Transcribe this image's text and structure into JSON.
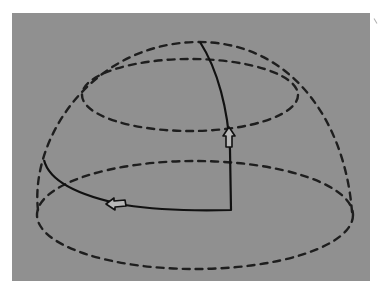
{
  "figure": {
    "colors": {
      "background": "#909090",
      "lines": "#1e1e1e",
      "arrow_fill": "#b8b8b8"
    },
    "elements": {
      "outer_dome": "dashed",
      "upper_latitude_circle": "dashed",
      "lower_latitude_circle": "dashed",
      "path": "solid",
      "arrows": [
        {
          "direction": "up",
          "location": "on meridian segment"
        },
        {
          "direction": "left",
          "location": "on base segment"
        }
      ]
    }
  }
}
